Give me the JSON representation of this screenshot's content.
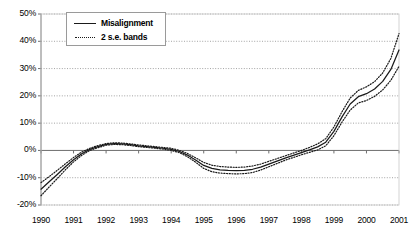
{
  "chart_data": {
    "type": "line",
    "title": "",
    "xlabel": "",
    "ylabel": "",
    "grid": true,
    "legend_position": "top-left",
    "xlim": [
      1990,
      2001
    ],
    "ylim": [
      -0.2,
      0.5
    ],
    "ytick_labels": [
      "50%",
      "40%",
      "30%",
      "20%",
      "10%",
      "0%",
      "-10%",
      "-20%"
    ],
    "ytick_values": [
      0.5,
      0.4,
      0.3,
      0.2,
      0.1,
      0.0,
      -0.1,
      -0.2
    ],
    "categories": [
      1990,
      1991,
      1992,
      1993,
      1994,
      1995,
      1996,
      1997,
      1998,
      1999,
      2000,
      2001
    ],
    "xtick_labels": [
      "1990",
      "1991",
      "1992",
      "1993",
      "1994",
      "1995",
      "1996",
      "1997",
      "1998",
      "1999",
      "2000",
      "2001"
    ],
    "series": [
      {
        "name": "Misalignment",
        "style": "solid",
        "color": "#1a1a1a",
        "x": [
          1990.0,
          1990.25,
          1990.5,
          1990.75,
          1991.0,
          1991.25,
          1991.5,
          1991.75,
          1992.0,
          1992.25,
          1992.5,
          1992.75,
          1993.0,
          1993.25,
          1993.5,
          1993.75,
          1994.0,
          1994.25,
          1994.5,
          1994.75,
          1995.0,
          1995.25,
          1995.5,
          1995.75,
          1996.0,
          1996.25,
          1996.5,
          1996.75,
          1997.0,
          1997.25,
          1997.5,
          1997.75,
          1998.0,
          1998.25,
          1998.5,
          1998.75,
          1999.0,
          1999.25,
          1999.5,
          1999.75,
          2000.0,
          2000.25,
          2000.5,
          2000.75,
          2001.0
        ],
        "values": [
          -0.142,
          -0.115,
          -0.088,
          -0.06,
          -0.034,
          -0.012,
          0.004,
          0.014,
          0.022,
          0.025,
          0.024,
          0.021,
          0.017,
          0.014,
          0.011,
          0.008,
          0.004,
          -0.004,
          -0.017,
          -0.035,
          -0.055,
          -0.066,
          -0.071,
          -0.073,
          -0.074,
          -0.073,
          -0.069,
          -0.061,
          -0.05,
          -0.039,
          -0.028,
          -0.018,
          -0.008,
          0.002,
          0.013,
          0.03,
          0.07,
          0.123,
          0.17,
          0.197,
          0.208,
          0.225,
          0.253,
          0.297,
          0.368
        ]
      },
      {
        "name": "Upper 2 s.e. band",
        "style": "dotted",
        "color": "#1a1a1a",
        "x": [
          1990.0,
          1990.25,
          1990.5,
          1990.75,
          1991.0,
          1991.25,
          1991.5,
          1991.75,
          1992.0,
          1992.25,
          1992.5,
          1992.75,
          1993.0,
          1993.25,
          1993.5,
          1993.75,
          1994.0,
          1994.25,
          1994.5,
          1994.75,
          1995.0,
          1995.25,
          1995.5,
          1995.75,
          1996.0,
          1996.25,
          1996.5,
          1996.75,
          1997.0,
          1997.25,
          1997.5,
          1997.75,
          1998.0,
          1998.25,
          1998.5,
          1998.75,
          1999.0,
          1999.25,
          1999.5,
          1999.75,
          2000.0,
          2000.25,
          2000.5,
          2000.75,
          2001.0
        ],
        "values": [
          -0.118,
          -0.096,
          -0.073,
          -0.049,
          -0.026,
          -0.006,
          0.008,
          0.018,
          0.025,
          0.028,
          0.027,
          0.024,
          0.02,
          0.017,
          0.014,
          0.011,
          0.008,
          0.0,
          -0.011,
          -0.027,
          -0.044,
          -0.054,
          -0.059,
          -0.061,
          -0.062,
          -0.061,
          -0.057,
          -0.05,
          -0.04,
          -0.03,
          -0.02,
          -0.01,
          0.0,
          0.011,
          0.024,
          0.043,
          0.086,
          0.142,
          0.192,
          0.22,
          0.233,
          0.252,
          0.284,
          0.337,
          0.428
        ]
      },
      {
        "name": "Lower 2 s.e. band",
        "style": "dotted",
        "color": "#1a1a1a",
        "x": [
          1990.0,
          1990.25,
          1990.5,
          1990.75,
          1991.0,
          1991.25,
          1991.5,
          1991.75,
          1992.0,
          1992.25,
          1992.5,
          1992.75,
          1993.0,
          1993.25,
          1993.5,
          1993.75,
          1994.0,
          1994.25,
          1994.5,
          1994.75,
          1995.0,
          1995.25,
          1995.5,
          1995.75,
          1996.0,
          1996.25,
          1996.5,
          1996.75,
          1997.0,
          1997.25,
          1997.5,
          1997.75,
          1998.0,
          1998.25,
          1998.5,
          1998.75,
          1999.0,
          1999.25,
          1999.5,
          1999.75,
          2000.0,
          2000.25,
          2000.5,
          2000.75,
          2001.0
        ],
        "values": [
          -0.166,
          -0.134,
          -0.103,
          -0.071,
          -0.042,
          -0.018,
          0.0,
          0.01,
          0.019,
          0.022,
          0.021,
          0.018,
          0.014,
          0.011,
          0.008,
          0.005,
          0.0,
          -0.008,
          -0.023,
          -0.043,
          -0.066,
          -0.078,
          -0.083,
          -0.085,
          -0.086,
          -0.085,
          -0.081,
          -0.072,
          -0.06,
          -0.048,
          -0.036,
          -0.026,
          -0.016,
          -0.007,
          0.002,
          0.017,
          0.054,
          0.104,
          0.148,
          0.174,
          0.183,
          0.198,
          0.222,
          0.257,
          0.308
        ]
      }
    ]
  },
  "legend": {
    "items": [
      {
        "label": "Misalignment",
        "style": "solid"
      },
      {
        "label": "2 s.e. bands",
        "style": "dotted"
      }
    ]
  }
}
